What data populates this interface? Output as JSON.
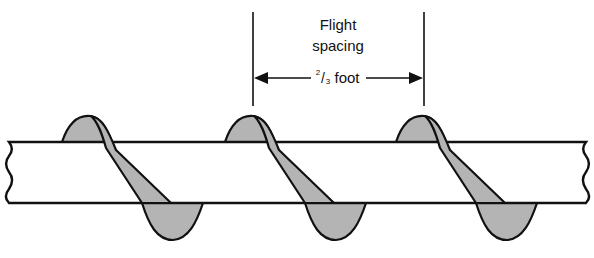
{
  "diagram": {
    "dimension_label_line1": "Flight",
    "dimension_label_line2": "spacing",
    "fraction_numerator": "2",
    "fraction_slash": "/",
    "fraction_denominator": "3",
    "dimension_unit": "foot",
    "flight_count": 3,
    "colors": {
      "outline": "#111111",
      "flight_fill": "#b4b4b4",
      "shaft_fill": "#ffffff"
    }
  }
}
